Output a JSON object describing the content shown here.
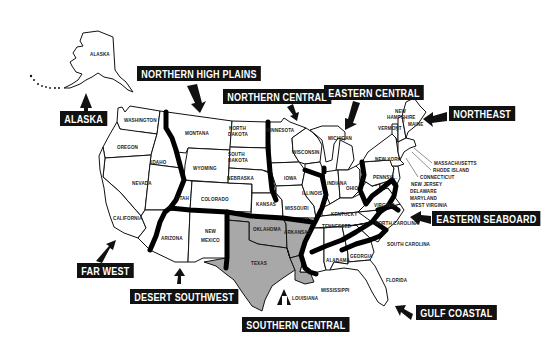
{
  "map": {
    "title": "U.S. Regions Map",
    "shaded_color": "#a8a8a8",
    "region_line_color": "#000000",
    "regions": [
      {
        "id": "alaska",
        "label": "ALASKA"
      },
      {
        "id": "northern-high-plains",
        "label": "NORTHERN HIGH PLAINS"
      },
      {
        "id": "northern-central",
        "label": "NORTHERN CENTRAL"
      },
      {
        "id": "eastern-central",
        "label": "EASTERN CENTRAL"
      },
      {
        "id": "northeast",
        "label": "NORTHEAST"
      },
      {
        "id": "eastern-seaboard",
        "label": "EASTERN SEABOARD"
      },
      {
        "id": "gulf-coastal",
        "label": "GULF COASTAL"
      },
      {
        "id": "southern-central",
        "label": "SOUTHERN CENTRAL"
      },
      {
        "id": "desert-southwest",
        "label": "DESERT SOUTHWEST"
      },
      {
        "id": "far-west",
        "label": "FAR WEST"
      }
    ],
    "states": {
      "alaska": "ALASKA",
      "washington": "WASHINGTON",
      "oregon": "OREGON",
      "idaho": "IDAHO",
      "nevada": "NEVADA",
      "california": "CALIFORNIA",
      "montana": "MONTANA",
      "wyoming": "WYOMING",
      "utah": "UTAH",
      "colorado": "COLORADO",
      "arizona": "ARIZONA",
      "new_mexico_1": "NEW",
      "new_mexico_2": "MEXICO",
      "north_dakota_1": "NORTH",
      "north_dakota_2": "DAKOTA",
      "south_dakota_1": "SOUTH",
      "south_dakota_2": "DAKOTA",
      "nebraska": "NEBRASKA",
      "kansas": "KANSAS",
      "oklahoma": "OKLAHOMA",
      "texas": "TEXAS",
      "minnesota": "MINNESOTA",
      "iowa": "IOWA",
      "missouri": "MISSOURI",
      "arkansas": "ARKANSAS",
      "louisiana": "LOUISIANA",
      "wisconsin": "WISCONSIN",
      "illinois": "ILLINOIS",
      "michigan": "MICHIGAN",
      "indiana": "INDIANA",
      "ohio": "OHIO",
      "kentucky": "KENTUCKY",
      "tennessee": "TENNESSEE",
      "mississippi": "MISSISSIPPI",
      "alabama": "ALABAMA",
      "georgia": "GEORGIA",
      "florida": "FLORIDA",
      "south_carolina": "SOUTH CAROLINA",
      "north_carolina": "NORTH CAROLINA",
      "virginia": "VIRGINIA",
      "west_virginia": "WEST VIRGINIA",
      "maryland": "MARYLAND",
      "delaware": "DELAWARE",
      "new_jersey": "NEW JERSEY",
      "pennsylvania": "PENNSYL.",
      "new_york": "NEW YORK",
      "connecticut": "CONNECTICUT",
      "rhode_island": "RHODE ISLAND",
      "massachusetts": "MASSACHUSETTS",
      "vermont": "VERMONT",
      "new_hampshire_1": "NEW",
      "new_hampshire_2": "HAMPSHIRE",
      "maine": "MAINE"
    }
  }
}
